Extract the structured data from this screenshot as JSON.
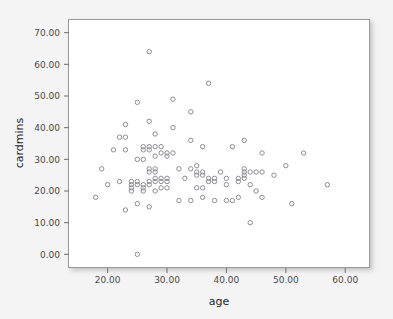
{
  "chart_data": {
    "type": "scatter",
    "title": "",
    "xlabel": "age",
    "ylabel": "cardmins",
    "xlim": [
      13.5,
      64.0
    ],
    "ylim": [
      -4.0,
      74.0
    ],
    "grid": false,
    "legend": null,
    "x_ticks": [
      20,
      30,
      40,
      50,
      60
    ],
    "y_ticks": [
      0,
      10,
      20,
      30,
      40,
      50,
      60,
      70
    ],
    "x_tick_labels": [
      "20.00",
      "30.00",
      "40.00",
      "50.00",
      "60.00"
    ],
    "y_tick_labels": [
      "0.00",
      "10.00",
      "20.00",
      "30.00",
      "40.00",
      "50.00",
      "60.00",
      "70.00"
    ],
    "marker": "open-circle",
    "marker_color": "#8d8d93",
    "point_count": 108,
    "points": [
      [
        18,
        18
      ],
      [
        19,
        27
      ],
      [
        20,
        22
      ],
      [
        21,
        33
      ],
      [
        22,
        23
      ],
      [
        22,
        37
      ],
      [
        23,
        14
      ],
      [
        23,
        33
      ],
      [
        23,
        37
      ],
      [
        23,
        41
      ],
      [
        24,
        20
      ],
      [
        24,
        21
      ],
      [
        24,
        22
      ],
      [
        24,
        23
      ],
      [
        25,
        0
      ],
      [
        25,
        16
      ],
      [
        25,
        22
      ],
      [
        25,
        23
      ],
      [
        25,
        30
      ],
      [
        25,
        48
      ],
      [
        26,
        20
      ],
      [
        26,
        21
      ],
      [
        26,
        22
      ],
      [
        26,
        30
      ],
      [
        26,
        33
      ],
      [
        26,
        34
      ],
      [
        27,
        15
      ],
      [
        27,
        22
      ],
      [
        27,
        23
      ],
      [
        27,
        26
      ],
      [
        27,
        27
      ],
      [
        27,
        33
      ],
      [
        27,
        34
      ],
      [
        27,
        42
      ],
      [
        27,
        64
      ],
      [
        28,
        20
      ],
      [
        28,
        23
      ],
      [
        28,
        24
      ],
      [
        28,
        26
      ],
      [
        28,
        27
      ],
      [
        28,
        31
      ],
      [
        28,
        34
      ],
      [
        28,
        38
      ],
      [
        29,
        21
      ],
      [
        29,
        23
      ],
      [
        29,
        24
      ],
      [
        29,
        32
      ],
      [
        29,
        34
      ],
      [
        30,
        21
      ],
      [
        30,
        23
      ],
      [
        30,
        24
      ],
      [
        30,
        31
      ],
      [
        30,
        32
      ],
      [
        31,
        32
      ],
      [
        31,
        40
      ],
      [
        31,
        49
      ],
      [
        32,
        17
      ],
      [
        32,
        27
      ],
      [
        33,
        24
      ],
      [
        34,
        17
      ],
      [
        34,
        27
      ],
      [
        34,
        36
      ],
      [
        34,
        45
      ],
      [
        35,
        21
      ],
      [
        35,
        25
      ],
      [
        35,
        26
      ],
      [
        35,
        28
      ],
      [
        36,
        18
      ],
      [
        36,
        21
      ],
      [
        36,
        25
      ],
      [
        36,
        26
      ],
      [
        36,
        34
      ],
      [
        37,
        23
      ],
      [
        37,
        24
      ],
      [
        37,
        54
      ],
      [
        38,
        17
      ],
      [
        38,
        23
      ],
      [
        38,
        24
      ],
      [
        39,
        26
      ],
      [
        40,
        17
      ],
      [
        40,
        22
      ],
      [
        40,
        24
      ],
      [
        41,
        17
      ],
      [
        41,
        34
      ],
      [
        42,
        18
      ],
      [
        42,
        23
      ],
      [
        42,
        24
      ],
      [
        43,
        24
      ],
      [
        43,
        25
      ],
      [
        43,
        26
      ],
      [
        43,
        27
      ],
      [
        43,
        36
      ],
      [
        44,
        10
      ],
      [
        44,
        22
      ],
      [
        44,
        26
      ],
      [
        45,
        20
      ],
      [
        45,
        26
      ],
      [
        46,
        18
      ],
      [
        46,
        26
      ],
      [
        46,
        32
      ],
      [
        48,
        25
      ],
      [
        50,
        28
      ],
      [
        51,
        16
      ],
      [
        53,
        32
      ],
      [
        57,
        22
      ]
    ]
  }
}
